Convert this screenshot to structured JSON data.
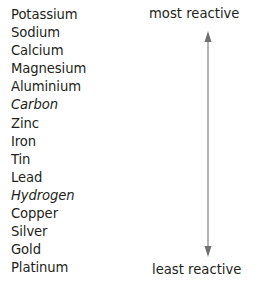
{
  "diagram": {
    "elements": [
      {
        "name": "Potassium",
        "italic": false
      },
      {
        "name": "Sodium",
        "italic": false
      },
      {
        "name": "Calcium",
        "italic": false
      },
      {
        "name": "Magnesium",
        "italic": false
      },
      {
        "name": "Aluminium",
        "italic": false
      },
      {
        "name": "Carbon",
        "italic": true
      },
      {
        "name": "Zinc",
        "italic": false
      },
      {
        "name": "Iron",
        "italic": false
      },
      {
        "name": "Tin",
        "italic": false
      },
      {
        "name": "Lead",
        "italic": false
      },
      {
        "name": "Hydrogen",
        "italic": true
      },
      {
        "name": "Copper",
        "italic": false
      },
      {
        "name": "Silver",
        "italic": false
      },
      {
        "name": "Gold",
        "italic": false
      },
      {
        "name": "Platinum",
        "italic": false
      }
    ],
    "top_label": "most reactive",
    "bottom_label": "least reactive",
    "arrow": {
      "icon": "double-headed-vertical-arrow",
      "color": "#808080"
    }
  }
}
